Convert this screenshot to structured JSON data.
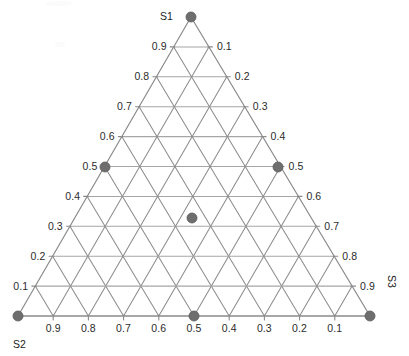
{
  "chart_data": {
    "type": "scatter",
    "plot_kind": "ternary-diagram",
    "title": "",
    "axes": [
      {
        "name": "S1",
        "vertex_label": "S1",
        "position": "top",
        "tick_side": "upper-right",
        "tick_labels": [
          "0.1",
          "0.2",
          "0.3",
          "0.4",
          "0.5",
          "0.6",
          "0.7",
          "0.8",
          "0.9"
        ]
      },
      {
        "name": "S2",
        "vertex_label": "S2",
        "position": "bottom-left",
        "tick_side": "upper-left",
        "tick_labels": [
          "0.9",
          "0.8",
          "0.7",
          "0.6",
          "0.5",
          "0.4",
          "0.3",
          "0.2",
          "0.1"
        ]
      },
      {
        "name": "S3",
        "vertex_label": "S3",
        "position": "bottom-right",
        "tick_side": "bottom",
        "tick_labels": [
          "0.9",
          "0.8",
          "0.7",
          "0.6",
          "0.5",
          "0.4",
          "0.3",
          "0.2",
          "0.1"
        ]
      }
    ],
    "left_axis_tick_labels": [
      "0.9",
      "0.8",
      "0.7",
      "0.6",
      "0.5",
      "0.4",
      "0.3",
      "0.2",
      "0.1"
    ],
    "right_axis_tick_labels": [
      "0.1",
      "0.2",
      "0.3",
      "0.4",
      "0.5",
      "0.6",
      "0.7",
      "0.8",
      "0.9"
    ],
    "bottom_axis_tick_labels": [
      "0.9",
      "0.8",
      "0.7",
      "0.6",
      "0.5",
      "0.4",
      "0.3",
      "0.2",
      "0.1"
    ],
    "grid_divisions": 10,
    "grid": true,
    "legend": "none",
    "points": [
      {
        "id": "p-apex",
        "S1": 1.0,
        "S2": 0.0,
        "S3": 0.0,
        "px": 191,
        "py": 17
      },
      {
        "id": "p-left-half",
        "S1": 0.5,
        "S2": 0.5,
        "S3": 0.0,
        "px": 105,
        "py": 167
      },
      {
        "id": "p-right-half",
        "S1": 0.5,
        "S2": 0.0,
        "S3": 0.5,
        "px": 278,
        "py": 167
      },
      {
        "id": "p-interior",
        "S1": 0.33,
        "S2": 0.33,
        "S3": 0.34,
        "px": 192,
        "py": 218
      },
      {
        "id": "p-bottom-left",
        "S1": 0.0,
        "S2": 1.0,
        "S3": 0.0,
        "px": 18,
        "py": 316
      },
      {
        "id": "p-bottom-center",
        "S1": 0.0,
        "S2": 0.5,
        "S3": 0.5,
        "px": 194,
        "py": 316
      },
      {
        "id": "p-bottom-right",
        "S1": 0.0,
        "S2": 0.0,
        "S3": 1.0,
        "px": 370,
        "py": 316
      }
    ]
  },
  "style": {
    "marker_color": "#6e6e6e",
    "marker_edge_color": "#5a5a5a",
    "marker_radius": 5,
    "grid_color": "#8d8d8d",
    "grid_horizontal_color": "#a6a6a6",
    "outline_color": "#8a8a8a",
    "background": "#ffffff",
    "label_color": "#2b2b2b"
  },
  "geometry": {
    "apex_x": 191,
    "apex_y": 17,
    "left_x": 18,
    "left_y": 316,
    "right_x": 370,
    "right_y": 316
  }
}
